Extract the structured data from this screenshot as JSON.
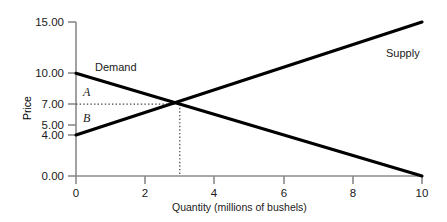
{
  "chart_data": {
    "type": "line",
    "title": "",
    "xlabel": "Quantity (millions of bushels)",
    "ylabel": "Price",
    "xlim": [
      0,
      10
    ],
    "ylim": [
      0,
      15
    ],
    "grid": false,
    "legend": "inline-labels",
    "xticks": [
      "0",
      "2",
      "4",
      "6",
      "8",
      "10"
    ],
    "xtick_values": [
      0,
      2,
      4,
      6,
      8,
      10
    ],
    "yticks": [
      "0.00",
      "4.00",
      "5.00",
      "7.00",
      "10.00",
      "15.00"
    ],
    "ytick_values": [
      0,
      4,
      5,
      7,
      10,
      15
    ],
    "series": [
      {
        "name": "Demand",
        "points": [
          [
            0,
            10
          ],
          [
            10,
            0
          ]
        ],
        "color": "#000000"
      },
      {
        "name": "Supply",
        "points": [
          [
            0,
            4
          ],
          [
            10,
            15
          ]
        ],
        "color": "#000000"
      }
    ],
    "annotations": [
      {
        "text": "Demand",
        "x": 1.2,
        "y": 10.6,
        "kind": "series-label"
      },
      {
        "text": "Supply",
        "x": 9.0,
        "y": 11.8,
        "kind": "series-label"
      },
      {
        "text": "A",
        "x": 0.45,
        "y": 8.6,
        "kind": "area-label"
      },
      {
        "text": "B",
        "x": 0.45,
        "y": 6.1,
        "kind": "area-label"
      }
    ],
    "equilibrium": {
      "x": 3,
      "y": 7.0,
      "price_label": "7.00",
      "quantity_label": "3"
    },
    "guides": [
      {
        "kind": "horizontal-dotted",
        "from": [
          0,
          7
        ],
        "to": [
          3,
          7
        ]
      },
      {
        "kind": "vertical-dotted",
        "from": [
          3,
          7
        ],
        "to": [
          3,
          0
        ]
      }
    ],
    "colors": {
      "axis": "#8a8a8a",
      "curve": "#000000",
      "guide": "#555555",
      "text": "#1a1a1a",
      "background": "#ffffff"
    }
  },
  "axes": {
    "y_title": "Price",
    "x_title": "Quantity (millions of bushels)",
    "y_labels": {
      "t15": "15.00",
      "t10": "10.00",
      "t7": "7.00",
      "t5": "5.00",
      "t4": "4.00",
      "t0": "0.00"
    },
    "x_labels": {
      "t0": "0",
      "t2": "2",
      "t4": "4",
      "t6": "6",
      "t8": "8",
      "t10": "10"
    }
  },
  "labels": {
    "demand": "Demand",
    "supply": "Supply",
    "area_a": "A",
    "area_b": "B"
  }
}
